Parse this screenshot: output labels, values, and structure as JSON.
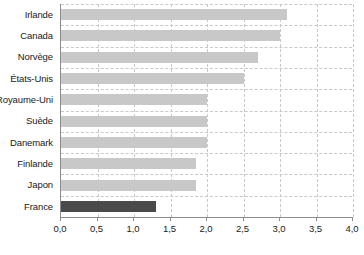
{
  "chart_data": {
    "type": "bar",
    "orientation": "horizontal",
    "title": "",
    "subtitle": "",
    "xlabel": "",
    "ylabel": "",
    "xlim": [
      0,
      4
    ],
    "xticks": [
      0,
      0.5,
      1,
      1.5,
      2,
      2.5,
      3,
      3.5,
      4
    ],
    "xtick_labels": [
      "0,0",
      "0,5",
      "1,0",
      "1,5",
      "2,0",
      "2,5",
      "3,0",
      "3,5",
      "4,0"
    ],
    "grid": true,
    "grid_style": "dashed",
    "legend": "none",
    "categories": [
      "Irlande",
      "Canada",
      "Norvège",
      "États-Unis",
      "Royaume-Uni",
      "Suède",
      "Danemark",
      "Finlande",
      "Japon",
      "France"
    ],
    "values": [
      3.1,
      3.0,
      2.7,
      2.5,
      2.0,
      2.0,
      2.0,
      1.85,
      1.85,
      1.3
    ],
    "highlight_category": "France",
    "colors": {
      "bar": "#c8c8c8",
      "bar_highlight": "#4a4a4a",
      "grid": "#c9c9c9",
      "axis": "#8c8c8c",
      "text": "#1a1a1a",
      "background": "#ffffff"
    }
  }
}
